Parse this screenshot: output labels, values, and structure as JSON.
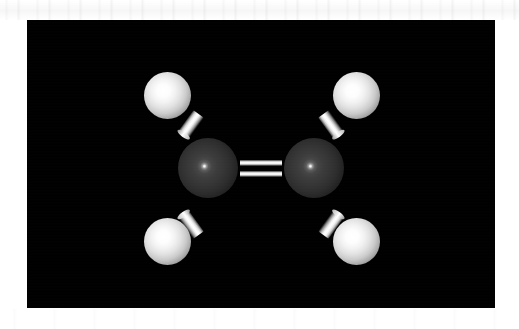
{
  "figure": {
    "kind": "3d-ball-and-stick-molecular-render",
    "molecule_name": "Ethylene",
    "molecular_formula": "C2H4",
    "background_color": "#000000",
    "page_color": "#ffffff",
    "render_panel": {
      "x": 27,
      "y": 20,
      "width": 468,
      "height": 288
    },
    "colors": {
      "carbon_sphere": "#3a3a3a",
      "hydrogen_sphere": "#e8e8e8",
      "bond_rod": "#ffffff",
      "specular_highlight": "#ffffff",
      "panel_background": "#000000",
      "margin_background": "#ffffff"
    },
    "atoms": [
      {
        "id": "C1",
        "element": "C",
        "label": "carbon-left",
        "cx": 208,
        "cy": 168,
        "diameter": 60
      },
      {
        "id": "C2",
        "element": "C",
        "label": "carbon-right",
        "cx": 314,
        "cy": 168,
        "diameter": 60
      },
      {
        "id": "H1",
        "element": "H",
        "label": "hydrogen-top-left",
        "cx": 167,
        "cy": 95,
        "diameter": 47
      },
      {
        "id": "H2",
        "element": "H",
        "label": "hydrogen-top-right",
        "cx": 356,
        "cy": 95,
        "diameter": 47
      },
      {
        "id": "H3",
        "element": "H",
        "label": "hydrogen-bottom-left",
        "cx": 167,
        "cy": 241,
        "diameter": 47
      },
      {
        "id": "H4",
        "element": "H",
        "label": "hydrogen-bottom-right",
        "cx": 356,
        "cy": 241,
        "diameter": 47
      }
    ],
    "bonds": [
      {
        "id": "B1",
        "label": "double-bond-C1-C2-upper-rod",
        "from": "C1",
        "to": "C2",
        "order": 2,
        "rod_index": 1,
        "x": 240,
        "y": 160,
        "length": 42,
        "thickness": 6,
        "angle": 0
      },
      {
        "id": "B2",
        "label": "double-bond-C1-C2-lower-rod",
        "from": "C1",
        "to": "C2",
        "order": 2,
        "rod_index": 2,
        "x": 240,
        "y": 171,
        "length": 42,
        "thickness": 6,
        "angle": 0
      },
      {
        "id": "B3",
        "label": "single-bond-C1-H1",
        "from": "C1",
        "to": "H1",
        "order": 1,
        "x": 178,
        "y": 118,
        "length": 26,
        "thickness": 13,
        "angle": -54
      },
      {
        "id": "B4",
        "label": "single-bond-C2-H2",
        "from": "C2",
        "to": "H2",
        "order": 1,
        "x": 318,
        "y": 118,
        "length": 26,
        "thickness": 13,
        "angle": 234
      },
      {
        "id": "B5",
        "label": "single-bond-C1-H3",
        "from": "C1",
        "to": "H3",
        "order": 1,
        "x": 178,
        "y": 218,
        "length": 26,
        "thickness": 13,
        "angle": 54
      },
      {
        "id": "B6",
        "label": "single-bond-C2-H4",
        "from": "C2",
        "to": "H4",
        "order": 1,
        "x": 318,
        "y": 218,
        "length": 26,
        "thickness": 13,
        "angle": 126
      }
    ],
    "caption": ""
  }
}
